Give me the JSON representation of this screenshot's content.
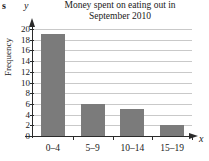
{
  "stray_glyph": "s",
  "axis_letters": {
    "x": "x",
    "y": "y"
  },
  "chart_data": {
    "type": "bar",
    "title": "Money spent on eating out in September 2010",
    "title_line1": "Money spent on eating out in",
    "title_line2": "September 2010",
    "xlabel": "",
    "ylabel": "Frequency",
    "categories": [
      "0–4",
      "5–9",
      "10–14",
      "15–19"
    ],
    "values": [
      19,
      6,
      5,
      2
    ],
    "ylim": [
      0,
      20
    ],
    "ytick_step": 2,
    "ytick_labels": [
      "0",
      "2",
      "4",
      "6",
      "8",
      "10",
      "12",
      "14",
      "16",
      "18",
      "20"
    ],
    "grid": true,
    "legend": null,
    "bar_color": "#7b7b7b",
    "gridline_color": "#c9c9c9",
    "axis_color": "#2b2b2b"
  }
}
